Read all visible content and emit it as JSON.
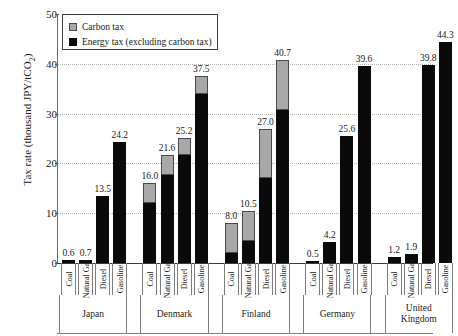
{
  "chart_data": {
    "type": "bar",
    "title": "",
    "xlabel": "",
    "ylabel": "Tax rate (thousand JPY/tCO2)",
    "ylabel_prefix": "Tax rate (thousand JPY/tCO",
    "ylabel_sub": "2",
    "ylabel_suffix": ")",
    "ylim": [
      0,
      50
    ],
    "yticks": [
      0,
      10,
      20,
      30,
      40,
      50
    ],
    "grid": "horizontal-dotted",
    "stacked": true,
    "legend_position": "top-left",
    "series": [
      {
        "name": "Carbon tax",
        "color": "#a8a8a8",
        "values": [
          0.0,
          0.0,
          0.0,
          0.0,
          4.0,
          4.0,
          3.5,
          3.5,
          6.0,
          6.0,
          10.0,
          10.0,
          0.0,
          0.0,
          0.0,
          0.0,
          0.0,
          0.0,
          0.0,
          0.0
        ]
      },
      {
        "name": "Energy tax (excluding carbon tax)",
        "color": "#0a0a0a",
        "values": [
          0.6,
          0.7,
          13.5,
          24.2,
          12.0,
          17.6,
          21.7,
          34.0,
          2.0,
          4.5,
          17.0,
          30.7,
          0.5,
          4.2,
          25.6,
          39.6,
          1.2,
          1.9,
          39.8,
          44.3
        ]
      }
    ],
    "categories": [
      "Coal",
      "Natural Gas",
      "Diesel",
      "Gasoline",
      "Coal",
      "Natural Gas",
      "Diesel",
      "Gasoline",
      "Coal",
      "Natural Gas",
      "Diesel",
      "Gasoline",
      "Coal",
      "Natural Gas",
      "Diesel",
      "Gasoline",
      "Coal",
      "Natural Gas",
      "Diesel",
      "Gasoline"
    ],
    "totals": [
      0.6,
      0.7,
      13.5,
      24.2,
      16.0,
      21.6,
      25.2,
      37.5,
      8.0,
      10.5,
      27.0,
      40.7,
      0.5,
      4.2,
      25.6,
      39.6,
      1.2,
      1.9,
      39.8,
      44.3
    ],
    "groups": [
      {
        "label": "Japan",
        "line1": "Japan",
        "line2": ""
      },
      {
        "label": "Denmark",
        "line1": "Denmark",
        "line2": ""
      },
      {
        "label": "Finland",
        "line1": "Finland",
        "line2": ""
      },
      {
        "label": "Germany",
        "line1": "Germany",
        "line2": ""
      },
      {
        "label": "United Kingdom",
        "line1": "United",
        "line2": "Kingdom"
      }
    ],
    "group_size": 4
  },
  "legend": {
    "items": [
      {
        "label": "Carbon tax",
        "swatch": "carbon-tax-swatch"
      },
      {
        "label": "Energy tax (excluding carbon tax)",
        "swatch": "energy-tax-swatch"
      }
    ]
  }
}
